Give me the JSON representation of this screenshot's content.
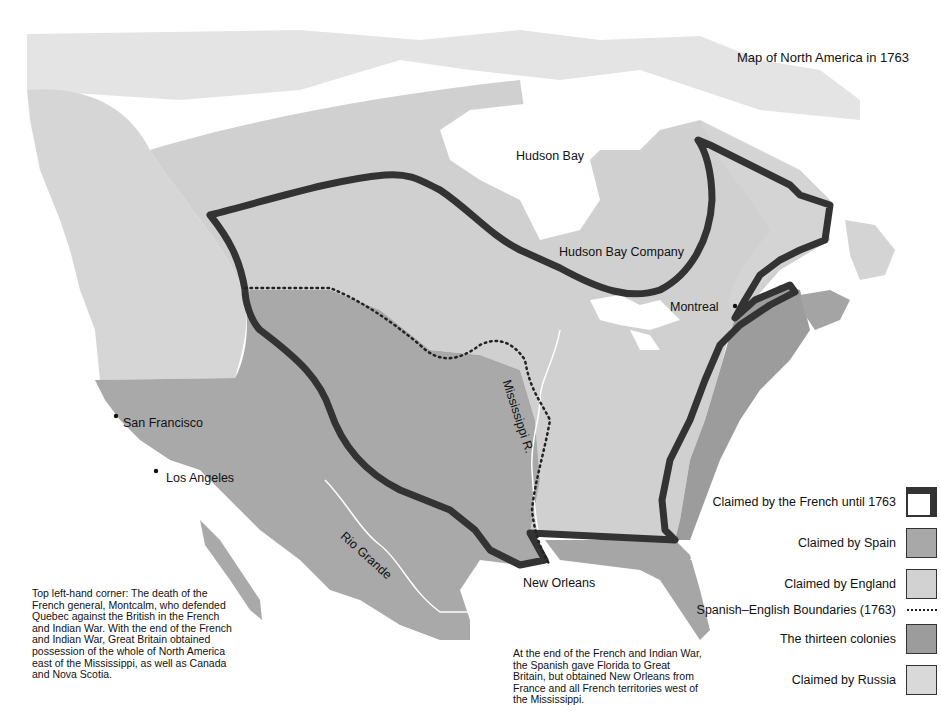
{
  "title": "Map of North America in 1763",
  "colors": {
    "background": "#ffffff",
    "spain": "#a8a8a8",
    "england": "#d2d2d2",
    "colonies": "#9c9c9c",
    "russia": "#d9d9d9",
    "arctic": "#e6e6e6",
    "french_border": "#333333"
  },
  "map_labels": {
    "hudson_bay": "Hudson Bay",
    "hudson_bay_company": "Hudson Bay Company",
    "montreal": "Montreal",
    "san_francisco": "San Francisco",
    "los_angeles": "Los Angeles",
    "mississippi": "Mississippi R.",
    "rio_grande": "Rio Grande",
    "new_orleans": "New Orleans"
  },
  "legend": [
    {
      "label": "Claimed by the French until 1763",
      "swatch": "french-outline"
    },
    {
      "label": "Claimed by Spain",
      "swatch": "spain"
    },
    {
      "label": "Claimed by England",
      "swatch": "england"
    },
    {
      "label": "Spanish–English Boundaries (1763)",
      "swatch": "dotted-line"
    },
    {
      "label": "The thirteen colonies",
      "swatch": "colonies"
    },
    {
      "label": "Claimed by Russia",
      "swatch": "russia"
    }
  ],
  "captions": {
    "left": "Top left-hand corner: The death of the French general, Montcalm, who defended Quebec against the British in the French and Indian War. With the end of the French and Indian War, Great Britain obtained possession of the whole of North America east of the Mississippi, as well as Canada and Nova Scotia.",
    "bottom": "At the end of the French and Indian War, the Spanish gave Florida to Great Britain, but obtained New Orleans from France and all French territories west of the Mississippi."
  }
}
